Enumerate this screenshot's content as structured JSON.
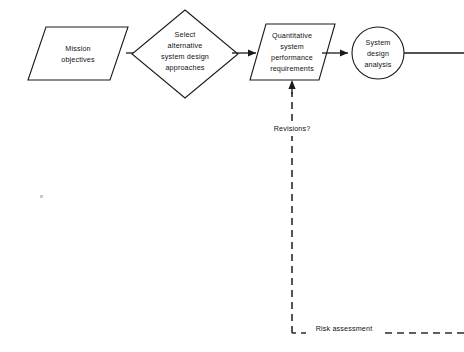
{
  "diagram": {
    "background_color": "#ffffff",
    "line_color": "#1a1a1a",
    "nodes": {
      "mission": {
        "shape": "parallelogram",
        "line1": "Mission",
        "line2": "objectives"
      },
      "select": {
        "shape": "diamond",
        "line1": "Select",
        "line2": "alternative",
        "line3": "system  design",
        "line4": "approaches"
      },
      "requirements": {
        "shape": "parallelogram",
        "line1": "Quantitative",
        "line2": "system",
        "line3": "performance",
        "line4": "requirements"
      },
      "analysis": {
        "shape": "circle",
        "line1": "System",
        "line2": "design",
        "line3": "analysis"
      }
    },
    "edges": {
      "revisions_label": "Revisions?",
      "risk_label": "Risk  assessment"
    }
  }
}
